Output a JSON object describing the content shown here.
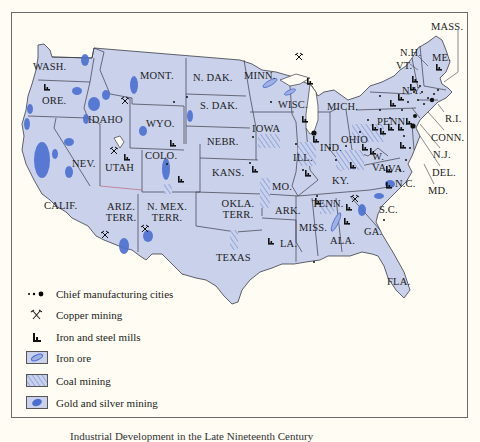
{
  "map": {
    "title_caption_partial": "Industrial Development in the Late Nineteenth Century",
    "colors": {
      "background": "#fffdf3",
      "land": "#c9d1eb",
      "border": "#3b3b48",
      "gold_silver": "#4b6fd0",
      "iron_ore": "#9fb0e3",
      "coal_hatch": "#7f93d6",
      "territory_border": "#c0506a"
    },
    "states": [
      {
        "abbr": "WASH.",
        "x": 48,
        "y": 66
      },
      {
        "abbr": "ORE.",
        "x": 44,
        "y": 98
      },
      {
        "abbr": "CALIF.",
        "x": 46,
        "y": 203
      },
      {
        "abbr": "NEV.",
        "x": 73,
        "y": 160
      },
      {
        "abbr": "IDAHO",
        "x": 86,
        "y": 117
      },
      {
        "abbr": "MONT.",
        "x": 140,
        "y": 73
      },
      {
        "abbr": "WYO.",
        "x": 148,
        "y": 122
      },
      {
        "abbr": "UTAH",
        "x": 107,
        "y": 165
      },
      {
        "abbr": "COLO.",
        "x": 146,
        "y": 154
      },
      {
        "abbr": "ARIZ. TERR.",
        "x": 103,
        "y": 203
      },
      {
        "abbr": "N. MEX. TERR.",
        "x": 144,
        "y": 203
      },
      {
        "abbr": "N. DAK.",
        "x": 193,
        "y": 75
      },
      {
        "abbr": "S. DAK.",
        "x": 200,
        "y": 103
      },
      {
        "abbr": "NEBR.",
        "x": 207,
        "y": 139
      },
      {
        "abbr": "KANS.",
        "x": 212,
        "y": 170
      },
      {
        "abbr": "OKLA. TERR.",
        "x": 222,
        "y": 200
      },
      {
        "abbr": "TEXAS",
        "x": 217,
        "y": 254
      },
      {
        "abbr": "MINN.",
        "x": 243,
        "y": 73
      },
      {
        "abbr": "IOWA",
        "x": 261,
        "y": 125
      },
      {
        "abbr": "MO.",
        "x": 273,
        "y": 183
      },
      {
        "abbr": "ARK.",
        "x": 280,
        "y": 208
      },
      {
        "abbr": "LA.",
        "x": 280,
        "y": 241
      },
      {
        "abbr": "WISC.",
        "x": 278,
        "y": 102
      },
      {
        "abbr": "ILL.",
        "x": 296,
        "y": 155
      },
      {
        "abbr": "MICH.",
        "x": 327,
        "y": 104
      },
      {
        "abbr": "IND.",
        "x": 326,
        "y": 144
      },
      {
        "abbr": "OHIO",
        "x": 352,
        "y": 136
      },
      {
        "abbr": "KY.",
        "x": 336,
        "y": 178
      },
      {
        "abbr": "TENN.",
        "x": 320,
        "y": 200
      },
      {
        "abbr": "MISS.",
        "x": 306,
        "y": 225
      },
      {
        "abbr": "ALA.",
        "x": 338,
        "y": 237
      },
      {
        "abbr": "GA.",
        "x": 373,
        "y": 229
      },
      {
        "abbr": "FLA.",
        "x": 402,
        "y": 279
      },
      {
        "abbr": "S.C.",
        "x": 390,
        "y": 206
      },
      {
        "abbr": "N.C.",
        "x": 407,
        "y": 180
      },
      {
        "abbr": "W. VA.",
        "x": 380,
        "y": 155
      },
      {
        "abbr": "VA.",
        "x": 395,
        "y": 165
      },
      {
        "abbr": "PENN.",
        "x": 386,
        "y": 118
      },
      {
        "abbr": "N.Y.",
        "x": 403,
        "y": 87
      },
      {
        "abbr": "VT.",
        "x": 404,
        "y": 63
      },
      {
        "abbr": "N.H.",
        "x": 408,
        "y": 50
      },
      {
        "abbr": "ME.",
        "x": 444,
        "y": 55
      },
      {
        "abbr": "MASS.",
        "x": 458,
        "y": 24
      },
      {
        "abbr": "R.I.",
        "x": 448,
        "y": 116
      },
      {
        "abbr": "CONN.",
        "x": 448,
        "y": 134
      },
      {
        "abbr": "N.J.",
        "x": 445,
        "y": 151
      },
      {
        "abbr": "DEL.",
        "x": 443,
        "y": 170
      },
      {
        "abbr": "MD.",
        "x": 437,
        "y": 187
      }
    ],
    "legend": [
      {
        "icon": "city-dots-icon",
        "label": "Chief manufacturing cities"
      },
      {
        "icon": "crossed-pickaxes-icon",
        "label": "Copper mining"
      },
      {
        "icon": "factory-icon",
        "label": "Iron and steel mills"
      },
      {
        "icon": "iron-ore-swatch",
        "label": "Iron ore"
      },
      {
        "icon": "coal-hatch-swatch",
        "label": "Coal mining"
      },
      {
        "icon": "gold-silver-swatch",
        "label": "Gold and silver mining"
      }
    ]
  }
}
